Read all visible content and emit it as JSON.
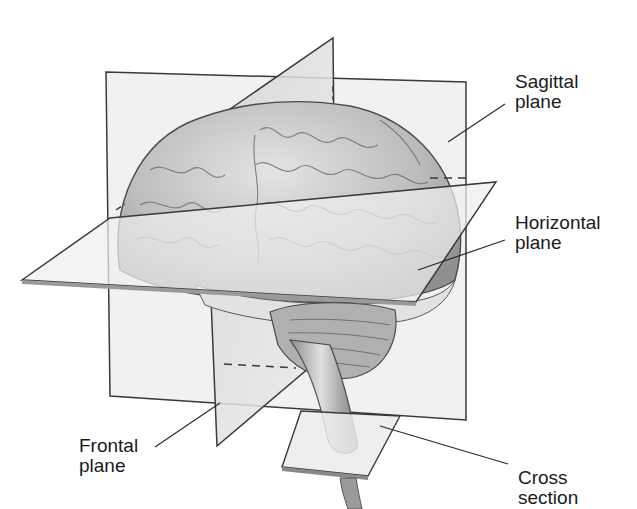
{
  "figure": {
    "colors": {
      "background": "#ffffff",
      "plane_fill": "#e6e6e6",
      "plane_fill_dark": "#c9c9c9",
      "plane_edge": "#3a3a3a",
      "brain_fill": "#bdbdbd",
      "brain_light": "#dcdcdc",
      "label_text": "#1a1a1a",
      "leader_line": "#2a2a2a"
    }
  },
  "labels": {
    "sagittal": {
      "line1": "Sagittal",
      "line2": "plane"
    },
    "horizontal": {
      "line1": "Horizontal",
      "line2": "plane"
    },
    "frontal": {
      "line1": "Frontal",
      "line2": "plane"
    },
    "cross": {
      "line1": "Cross",
      "line2": "section"
    }
  }
}
